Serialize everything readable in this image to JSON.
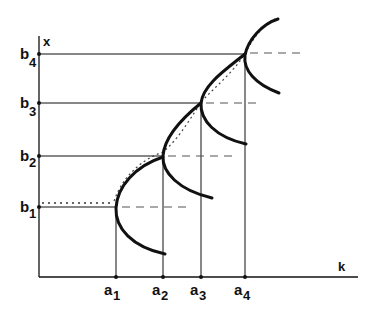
{
  "diagram": {
    "axes": {
      "x_label": "k",
      "y_label": "x"
    },
    "x_ticks": [
      {
        "base": "a",
        "sub": "1"
      },
      {
        "base": "a",
        "sub": "2"
      },
      {
        "base": "a",
        "sub": "3"
      },
      {
        "base": "a",
        "sub": "4"
      }
    ],
    "y_ticks": [
      {
        "base": "b",
        "sub": "1"
      },
      {
        "base": "b",
        "sub": "2"
      },
      {
        "base": "b",
        "sub": "3"
      },
      {
        "base": "b",
        "sub": "4"
      }
    ],
    "points": [
      {
        "name": "(a1,b1)"
      },
      {
        "name": "(a2,b2)"
      },
      {
        "name": "(a3,b3)"
      },
      {
        "name": "(a4,b4)"
      }
    ],
    "colors": {
      "ink": "#111111",
      "dash": "#555555",
      "background": "#ffffff"
    }
  }
}
